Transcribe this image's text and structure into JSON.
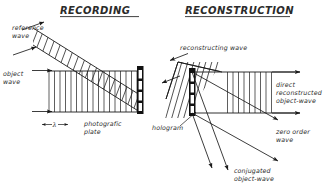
{
  "figure": {
    "ink_color": "#1a1a1a",
    "background": "#ffffff"
  },
  "panels": [
    {
      "id": "recording",
      "title": "RECORDING",
      "labels": [
        {
          "name": "reference-wave-label",
          "line1": "reference",
          "line2": "wave"
        },
        {
          "name": "object-wave-label",
          "line1": "object",
          "line2": "wave"
        },
        {
          "name": "photografic-plate-label",
          "line1": "photografic",
          "line2": "plate"
        },
        {
          "name": "wavelength-label",
          "text": "λ"
        }
      ]
    },
    {
      "id": "reconstruction",
      "title": "RECONSTRUCTION",
      "labels": [
        {
          "name": "reconstructing-wave-label",
          "line1": "reconstructing wave",
          "line2": ""
        },
        {
          "name": "hologram-label",
          "line1": "hologram",
          "line2": ""
        },
        {
          "name": "direct-reconstructed-object-wave-label",
          "line1": "direct",
          "line2": "reconstructed",
          "line3": "object-wave"
        },
        {
          "name": "zero-order-wave-label",
          "line1": "zero order",
          "line2": "wave"
        },
        {
          "name": "conjugated-object-wave-label",
          "line1": "conjugated",
          "line2": "object-wave"
        }
      ]
    }
  ],
  "text": {
    "recording_title": "RECORDING",
    "reconstruction_title": "RECONSTRUCTION",
    "reference_wave_1": "reference",
    "reference_wave_2": "wave",
    "object_wave_1": "object",
    "object_wave_2": "wave",
    "photografic_plate_1": "photografic",
    "photografic_plate_2": "plate",
    "lambda": "λ",
    "reconstructing_wave": "reconstructing wave",
    "hologram": "hologram",
    "direct_1": "direct",
    "direct_2": "reconstructed",
    "direct_3": "object-wave",
    "zero_order_1": "zero order",
    "zero_order_2": "wave",
    "conjugated_1": "conjugated",
    "conjugated_2": "object-wave"
  }
}
